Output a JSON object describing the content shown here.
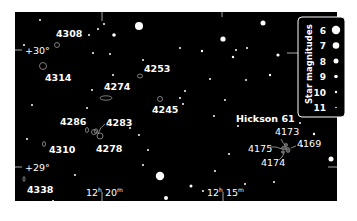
{
  "chart_data": {
    "type": "star-chart",
    "title": "",
    "axes": {
      "dec_labels": [
        {
          "text": "+30°",
          "y": 50
        },
        {
          "text": "+29°",
          "y": 167
        }
      ],
      "ra_labels": [
        {
          "h": "12",
          "m": "20",
          "x": 102
        },
        {
          "h": "12",
          "m": "15",
          "x": 223
        }
      ]
    },
    "legend": {
      "title": "Star magnitudes",
      "position": "top-right",
      "entries": [
        {
          "mag": "6",
          "r": 4.2
        },
        {
          "mag": "7",
          "r": 3.3
        },
        {
          "mag": "8",
          "r": 2.5
        },
        {
          "mag": "9",
          "r": 1.8
        },
        {
          "mag": "10",
          "r": 1.2
        },
        {
          "mag": "11",
          "r": 0.8
        }
      ]
    },
    "galaxies": [
      {
        "name": "4308",
        "lx": 56,
        "ly": 37,
        "gx": 57,
        "gy": 45,
        "rx": 2.5,
        "ry": 2.5
      },
      {
        "name": "4314",
        "lx": 45,
        "ly": 81,
        "gx": 43,
        "gy": 66,
        "rx": 3.5,
        "ry": 3.5
      },
      {
        "name": "4253",
        "lx": 144,
        "ly": 72,
        "gx": 140,
        "gy": 76,
        "rx": 2.5,
        "ry": 2
      },
      {
        "name": "4274",
        "lx": 104,
        "ly": 90,
        "gx": 106,
        "gy": 98,
        "rx": 6,
        "ry": 2.2
      },
      {
        "name": "4245",
        "lx": 152,
        "ly": 113,
        "gx": 160,
        "gy": 99,
        "rx": 2.5,
        "ry": 2.5
      },
      {
        "name": "4286",
        "lx": 60,
        "ly": 125,
        "gx": 87,
        "gy": 130,
        "rx": 1.5,
        "ry": 2.5
      },
      {
        "name": "4283",
        "lx": 106,
        "ly": 126,
        "gx": 100,
        "gy": 136,
        "rx": 3,
        "ry": 3
      },
      {
        "name": "4310",
        "lx": 49,
        "ly": 153,
        "gx": 44,
        "gy": 144,
        "rx": 1.5,
        "ry": 2.5
      },
      {
        "name": "4278",
        "lx": 96,
        "ly": 152,
        "gx": 94,
        "gy": 132,
        "rx": 2.5,
        "ry": 2.5
      },
      {
        "name": "4338",
        "lx": 27,
        "ly": 193,
        "gx": 24,
        "gy": 179,
        "rx": 1,
        "ry": 2.5
      }
    ],
    "hickson": {
      "name": "Hickson 61",
      "lx": 236,
      "ly": 122,
      "cx": 286,
      "cy": 149,
      "members": [
        {
          "name": "4173",
          "lx": 275,
          "ly": 135
        },
        {
          "name": "4169",
          "lx": 297,
          "ly": 147
        },
        {
          "name": "4175",
          "lx": 248,
          "ly": 152
        },
        {
          "name": "4174",
          "lx": 261,
          "ly": 166
        }
      ]
    },
    "stars": [
      {
        "x": 139,
        "y": 26,
        "r": 4
      },
      {
        "x": 160,
        "y": 176,
        "r": 4.2
      },
      {
        "x": 331,
        "y": 159,
        "r": 2.5
      },
      {
        "x": 114,
        "y": 35,
        "r": 1.8
      },
      {
        "x": 223,
        "y": 39,
        "r": 2.6
      },
      {
        "x": 263,
        "y": 23,
        "r": 2.5
      },
      {
        "x": 278,
        "y": 55,
        "r": 1.6
      },
      {
        "x": 166,
        "y": 198,
        "r": 2
      },
      {
        "x": 198,
        "y": 208,
        "r": 1.5
      },
      {
        "x": 226,
        "y": 209,
        "r": 1.8
      },
      {
        "x": 270,
        "y": 207,
        "r": 1.8
      },
      {
        "x": 40,
        "y": 20,
        "r": 1
      },
      {
        "x": 24,
        "y": 45,
        "r": 1
      },
      {
        "x": 89,
        "y": 35,
        "r": 1
      },
      {
        "x": 93,
        "y": 53,
        "r": 1
      },
      {
        "x": 110,
        "y": 54,
        "r": 1
      },
      {
        "x": 98,
        "y": 29,
        "r": 1
      },
      {
        "x": 104,
        "y": 24,
        "r": 1
      },
      {
        "x": 143,
        "y": 60,
        "r": 1
      },
      {
        "x": 113,
        "y": 75,
        "r": 1
      },
      {
        "x": 92,
        "y": 90,
        "r": 1
      },
      {
        "x": 32,
        "y": 105,
        "r": 1
      },
      {
        "x": 87,
        "y": 108,
        "r": 1
      },
      {
        "x": 180,
        "y": 48,
        "r": 1
      },
      {
        "x": 202,
        "y": 51,
        "r": 1.2
      },
      {
        "x": 233,
        "y": 57,
        "r": 1.2
      },
      {
        "x": 236,
        "y": 50,
        "r": 1
      },
      {
        "x": 247,
        "y": 48,
        "r": 1
      },
      {
        "x": 210,
        "y": 79,
        "r": 1
      },
      {
        "x": 246,
        "y": 80,
        "r": 1
      },
      {
        "x": 270,
        "y": 75,
        "r": 1.2
      },
      {
        "x": 225,
        "y": 100,
        "r": 1
      },
      {
        "x": 185,
        "y": 91,
        "r": 1
      },
      {
        "x": 180,
        "y": 98,
        "r": 1
      },
      {
        "x": 183,
        "y": 104,
        "r": 1
      },
      {
        "x": 214,
        "y": 116,
        "r": 1
      },
      {
        "x": 238,
        "y": 126,
        "r": 1
      },
      {
        "x": 300,
        "y": 123,
        "r": 1
      },
      {
        "x": 314,
        "y": 134,
        "r": 1.2
      },
      {
        "x": 302,
        "y": 146,
        "r": 1
      },
      {
        "x": 229,
        "y": 154,
        "r": 1
      },
      {
        "x": 215,
        "y": 171,
        "r": 1
      },
      {
        "x": 274,
        "y": 182,
        "r": 1
      },
      {
        "x": 130,
        "y": 128,
        "r": 1
      },
      {
        "x": 139,
        "y": 135,
        "r": 1
      },
      {
        "x": 148,
        "y": 150,
        "r": 1
      },
      {
        "x": 143,
        "y": 165,
        "r": 1
      },
      {
        "x": 27,
        "y": 139,
        "r": 1
      },
      {
        "x": 75,
        "y": 175,
        "r": 1
      },
      {
        "x": 53,
        "y": 201,
        "r": 1
      },
      {
        "x": 191,
        "y": 186,
        "r": 1.5
      },
      {
        "x": 203,
        "y": 191,
        "r": 1
      },
      {
        "x": 245,
        "y": 184,
        "r": 1
      }
    ]
  },
  "legend": {
    "title": "Star magnitudes",
    "mags": [
      "6",
      "7",
      "8",
      "9",
      "10",
      "11"
    ]
  },
  "labels": {
    "dec_30": "+30°",
    "dec_29": "+29°",
    "ra_20_h": "12",
    "ra_20_m": "20",
    "ra_15_h": "12",
    "ra_15_m": "15",
    "hickson": "Hickson 61"
  },
  "colors": {
    "sky": "#000000",
    "frame_outer": "#ffffff",
    "ink": "#ffffff",
    "galaxy_stroke": "#9a9a9a",
    "leader": "#bfbfbf",
    "tick": "#cfcfcf"
  }
}
